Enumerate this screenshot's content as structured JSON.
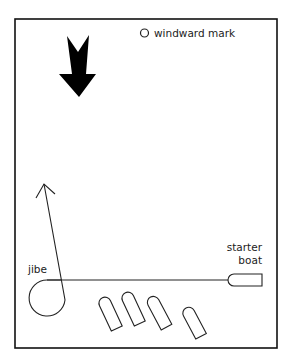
{
  "diagram": {
    "labels": {
      "windward_mark": "windward mark",
      "jibe": "jibe",
      "starter_line1": "starter",
      "starter_line2": "boat"
    },
    "elements": {
      "wind_arrow": "wind-direction-arrow",
      "windward_mark": "circle",
      "starter_boat": "boat",
      "start_line": "line",
      "jibe_path": "loop-with-arrow",
      "boats_count": 4
    },
    "colors": {
      "ink": "#111111",
      "background": "#ffffff"
    }
  }
}
